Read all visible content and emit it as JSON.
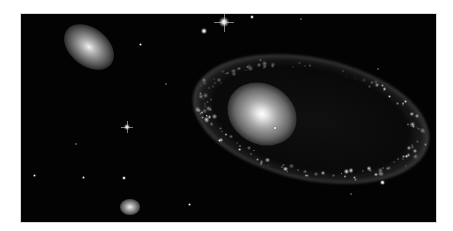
{
  "image": {
    "subject": "ring galaxy",
    "description": "Astronomical photograph of a ring galaxy with a bright off-center nucleus, a neighboring elliptical galaxy at top-left, a small galaxy at bottom, and scattered foreground stars on a black background",
    "palette": {
      "background": "#030303",
      "frame": "#ffffff",
      "core": "#ffffff",
      "ring": "#9a9a9a"
    }
  }
}
